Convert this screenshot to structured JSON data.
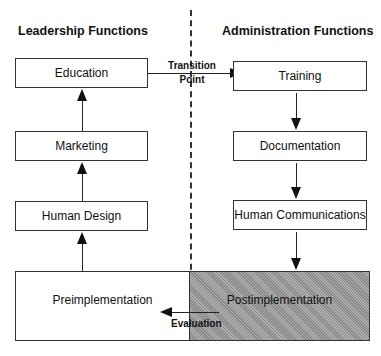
{
  "headings": {
    "left": "Leadership Functions",
    "right": "Administration Functions"
  },
  "leadership_boxes": [
    "Education",
    "Marketing",
    "Human Design"
  ],
  "administration_boxes": [
    "Training",
    "Documentation",
    "Human Communications"
  ],
  "transition": {
    "line1": "Transition",
    "line2": "Point"
  },
  "bottom": {
    "pre": "Preimplementation",
    "post": "Postimplementation",
    "evaluation": "Evaluation"
  }
}
